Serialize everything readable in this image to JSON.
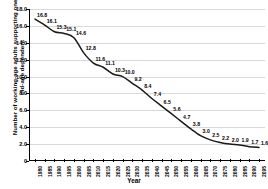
{
  "chart_data": {
    "type": "line",
    "title": "",
    "xlabel": "Year",
    "ylabel": "Number of working-age adults supporting one old-age dependent",
    "ylim": [
      0,
      18
    ],
    "xlim": [
      1980,
      2095
    ],
    "grid": true,
    "legend": false,
    "y_ticks": [
      "18.0",
      "16.0",
      "14.0",
      "12.0",
      "10.0",
      "8.0",
      "6.0",
      "4.0",
      "2.0",
      "0"
    ],
    "y_tick_values": [
      18.0,
      16.0,
      14.0,
      12.0,
      10.0,
      8.0,
      6.0,
      4.0,
      2.0,
      0
    ],
    "categories": [
      "1980",
      "1985",
      "1990",
      "1995",
      "2000",
      "2005",
      "2010",
      "2015",
      "2020",
      "2025",
      "2030",
      "2035",
      "2040",
      "2045",
      "2050",
      "2055",
      "2060",
      "2065",
      "2070",
      "2075",
      "2080",
      "2085",
      "2090",
      "2095"
    ],
    "values": [
      16.8,
      16.1,
      15.3,
      15.1,
      14.6,
      12.8,
      11.6,
      11.1,
      10.3,
      10.0,
      9.2,
      8.4,
      7.4,
      6.5,
      5.6,
      4.7,
      3.8,
      3.0,
      2.5,
      2.2,
      2.0,
      1.9,
      1.7,
      1.6
    ],
    "point_labels": [
      "16.8",
      "16.1",
      "15.3",
      "15.1",
      "14.6",
      "12.8",
      "11.6",
      "11.1",
      "10.3",
      "10.0",
      "9.2",
      "8.4",
      "7.4",
      "6.5",
      "5.6",
      "4.7",
      "3.8",
      "3.0",
      "2.5",
      "2.2",
      "2.0",
      "1.9",
      "1.7",
      "1.6"
    ],
    "series": [
      {
        "name": "Old-age support ratio",
        "color": "#1a1a1a",
        "values": [
          16.8,
          16.1,
          15.3,
          15.1,
          14.6,
          12.8,
          11.6,
          11.1,
          10.3,
          10.0,
          9.2,
          8.4,
          7.4,
          6.5,
          5.6,
          4.7,
          3.8,
          3.0,
          2.5,
          2.2,
          2.0,
          1.9,
          1.7,
          1.6
        ]
      }
    ],
    "colors": {
      "line": "#1a1a1a",
      "grid": "#d9d9d9",
      "axis": "#000000",
      "text": "#000000",
      "background": "#ffffff"
    }
  }
}
